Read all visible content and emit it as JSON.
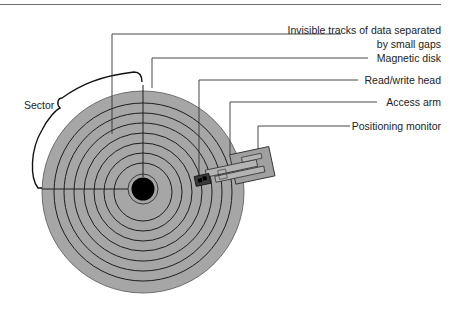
{
  "diagram": {
    "type": "labeled-illustration",
    "colors": {
      "disk_fill": "#a6a6a6",
      "track_line": "#1e1e1e",
      "hub": "#000000",
      "leader_line": "#333333",
      "head": "#3a3a3a",
      "top_rule": "#6e6e6e"
    },
    "labels": {
      "tracks_line1": "Invisible tracks of data separated",
      "tracks_line2": "by small gaps",
      "magnetic_disk": "Magnetic disk",
      "read_write_head": "Read/write head",
      "access_arm": "Access arm",
      "positioning_monitor": "Positioning monitor",
      "sector": "Sector"
    },
    "track_count": 7
  }
}
